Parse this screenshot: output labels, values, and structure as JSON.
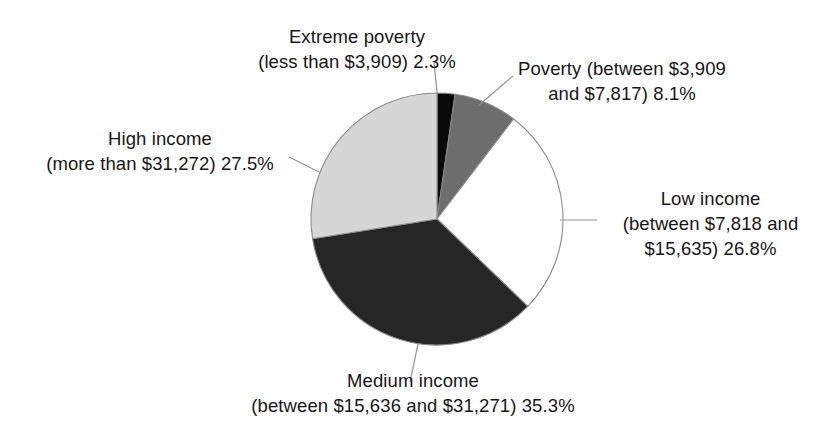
{
  "chart_data": {
    "type": "pie",
    "title": "",
    "xlabel": "",
    "ylabel": "",
    "legend_position": "none",
    "grid": false,
    "categories": [
      "Extreme poverty (less than $3,909)",
      "Poverty (between $3,909 and $7,817)",
      "Low income (between $7,818 and $15,635)",
      "Medium income (between $15,636 and $31,271)",
      "High income (more than $31,272)"
    ],
    "values": [
      2.3,
      8.1,
      26.8,
      35.3,
      27.5
    ],
    "value_unit": "%",
    "slice_colors": [
      "#0a0a0a",
      "#6d6d6d",
      "#ffffff",
      "#262626",
      "#d6d6d6"
    ],
    "start_angle_deg": 0,
    "direction": "clockwise",
    "slices": [
      {
        "name": "extreme-poverty",
        "label_lines": [
          "Extreme poverty",
          "(less than $3,909) 2.3%"
        ],
        "percent": 2.3,
        "color": "#0a0a0a"
      },
      {
        "name": "poverty",
        "label_lines": [
          "Poverty (between $3,909",
          "and $7,817) 8.1%"
        ],
        "percent": 8.1,
        "color": "#6d6d6d"
      },
      {
        "name": "low-income",
        "label_lines": [
          "Low income",
          "(between $7,818 and",
          "$15,635) 26.8%"
        ],
        "percent": 26.8,
        "color": "#ffffff"
      },
      {
        "name": "medium-income",
        "label_lines": [
          "Medium income",
          "(between $15,636 and $31,271) 35.3%"
        ],
        "percent": 35.3,
        "color": "#262626"
      },
      {
        "name": "high-income",
        "label_lines": [
          "High income",
          "(more than $31,272) 27.5%"
        ],
        "percent": 27.5,
        "color": "#d6d6d6"
      }
    ]
  },
  "labels": {
    "extreme_poverty": {
      "line1": "Extreme poverty",
      "line2": "(less than $3,909) 2.3%"
    },
    "poverty": {
      "line1": "Poverty (between $3,909",
      "line2": "and $7,817) 8.1%"
    },
    "low_income": {
      "line1": "Low income",
      "line2": "(between $7,818 and",
      "line3": "$15,635) 26.8%"
    },
    "medium_income": {
      "line1": "Medium income",
      "line2": "(between $15,636 and $31,271) 35.3%"
    },
    "high_income": {
      "line1": "High income",
      "line2": "(more than $31,272) 27.5%"
    }
  },
  "colors": {
    "background": "#ffffff",
    "text": "#161616",
    "outline": "#8a8a8a",
    "leader": "#8f8f8f"
  }
}
